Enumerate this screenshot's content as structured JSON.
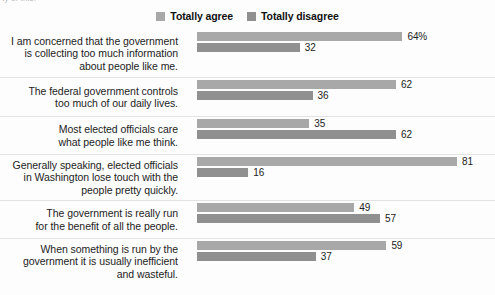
{
  "top_clipped_text": "ty of this.",
  "legend": {
    "items": [
      {
        "label": "Totally agree",
        "color": "#a8a8a8",
        "swatch_name": "legend-swatch-agree"
      },
      {
        "label": "Totally disagree",
        "color": "#909090",
        "swatch_name": "legend-swatch-disagree"
      }
    ]
  },
  "chart_data": {
    "type": "bar",
    "orientation": "horizontal",
    "title": "",
    "subtitle": "",
    "xlabel": "",
    "ylabel": "",
    "xlim": [
      0,
      81
    ],
    "grid": false,
    "legend_position": "top-center",
    "value_unit": "percent",
    "categories": [
      "I am concerned that the government\nis collecting too much information\nabout people like me.",
      "The federal government controls\ntoo much of our daily lives.",
      "Most elected officials care\nwhat people like me think.",
      "Generally speaking, elected officials\nin Washington lose touch with the\npeople pretty quickly.",
      "The government is really run\nfor the benefit of all the people.",
      "When something is run by the\ngovernment it is usually inefficient\nand wasteful."
    ],
    "series": [
      {
        "name": "Totally agree",
        "color": "#a8a8a8",
        "values": [
          64,
          62,
          35,
          81,
          49,
          59
        ]
      },
      {
        "name": "Totally disagree",
        "color": "#909090",
        "values": [
          32,
          36,
          62,
          16,
          57,
          37
        ]
      }
    ],
    "value_labels": [
      [
        "64%",
        "32"
      ],
      [
        "62",
        "36"
      ],
      [
        "35",
        "62"
      ],
      [
        "81",
        "16"
      ],
      [
        "49",
        "57"
      ],
      [
        "59",
        "37"
      ]
    ],
    "row_heights": [
      48,
      39,
      38,
      46,
      38,
      45
    ]
  }
}
